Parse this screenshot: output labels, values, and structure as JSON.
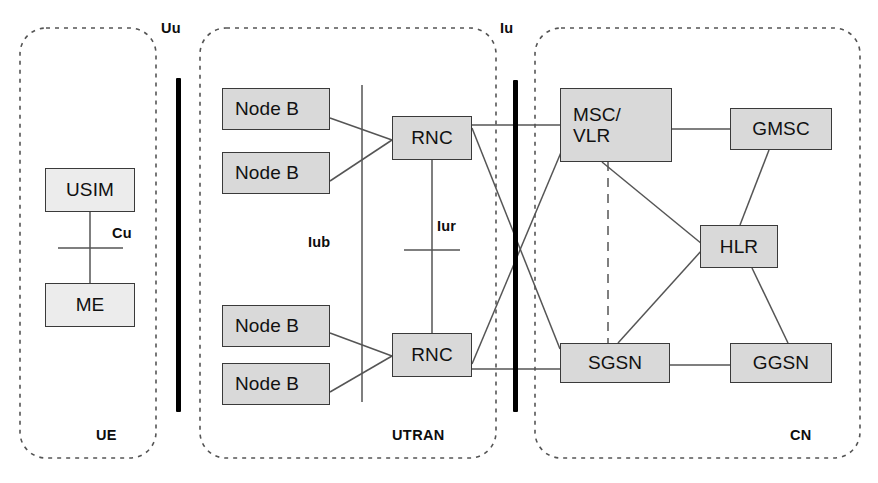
{
  "diagram": {
    "canvas": {
      "width": 878,
      "height": 483
    },
    "background_color": "#ffffff",
    "box_fill_color": "#d9d9d9",
    "box_border_color": "#3a3a3a",
    "line_color": "#555555",
    "domains": [
      {
        "id": "ue",
        "label": "UE",
        "x": 20,
        "y": 28,
        "width": 136,
        "height": 430
      },
      {
        "id": "utran",
        "label": "UTRAN",
        "x": 200,
        "y": 28,
        "width": 296,
        "height": 430
      },
      {
        "id": "cn",
        "label": "CN",
        "x": 535,
        "y": 28,
        "width": 325,
        "height": 430
      }
    ],
    "interfaces": [
      {
        "id": "uu",
        "label": "Uu",
        "style": "thick-bar",
        "x": 178,
        "y_top": 78,
        "y_bottom": 412
      },
      {
        "id": "iu",
        "label": "Iu",
        "style": "thick-bar",
        "x": 515,
        "y_top": 80,
        "y_bottom": 412
      },
      {
        "id": "iub",
        "label": "Iub",
        "style": "thin-line",
        "x": 362,
        "y_top": 85,
        "y_bottom": 402
      },
      {
        "id": "iur",
        "label": "Iur",
        "style": "tick",
        "x": 432,
        "y": 250
      },
      {
        "id": "cu",
        "label": "Cu",
        "style": "tick",
        "x": 85,
        "y": 247
      }
    ],
    "nodes": [
      {
        "id": "usim",
        "label": "USIM",
        "x": 45,
        "y": 168,
        "width": 90,
        "height": 44,
        "fill": "#ececec"
      },
      {
        "id": "me",
        "label": "ME",
        "x": 45,
        "y": 283,
        "width": 90,
        "height": 44,
        "fill": "#ececec"
      },
      {
        "id": "nodeb1",
        "label": "Node B",
        "x": 222,
        "y": 88,
        "width": 108,
        "height": 42,
        "fill": "#d9d9d9"
      },
      {
        "id": "nodeb2",
        "label": "Node B",
        "x": 222,
        "y": 152,
        "width": 108,
        "height": 42,
        "fill": "#d9d9d9"
      },
      {
        "id": "nodeb3",
        "label": "Node B",
        "x": 222,
        "y": 305,
        "width": 108,
        "height": 42,
        "fill": "#d9d9d9"
      },
      {
        "id": "nodeb4",
        "label": "Node B",
        "x": 222,
        "y": 363,
        "width": 108,
        "height": 42,
        "fill": "#d9d9d9"
      },
      {
        "id": "rnc1",
        "label": "RNC",
        "x": 392,
        "y": 116,
        "width": 80,
        "height": 44,
        "fill": "#d9d9d9"
      },
      {
        "id": "rnc2",
        "label": "RNC",
        "x": 392,
        "y": 333,
        "width": 80,
        "height": 44,
        "fill": "#d9d9d9"
      },
      {
        "id": "mscvlr",
        "label": "MSC/\nVLR",
        "x": 560,
        "y": 88,
        "width": 112,
        "height": 74,
        "fill": "#d9d9d9"
      },
      {
        "id": "gmsc",
        "label": "GMSC",
        "x": 730,
        "y": 108,
        "width": 102,
        "height": 42,
        "fill": "#d9d9d9"
      },
      {
        "id": "hlr",
        "label": "HLR",
        "x": 700,
        "y": 225,
        "width": 78,
        "height": 43,
        "fill": "#d9d9d9"
      },
      {
        "id": "sgsn",
        "label": "SGSN",
        "x": 560,
        "y": 343,
        "width": 110,
        "height": 40,
        "fill": "#d9d9d9"
      },
      {
        "id": "ggsn",
        "label": "GGSN",
        "x": 730,
        "y": 343,
        "width": 102,
        "height": 40,
        "fill": "#d9d9d9"
      }
    ],
    "links": [
      {
        "from": "usim",
        "to": "me",
        "style": "solid",
        "interface": "Cu"
      },
      {
        "from": "nodeb1",
        "to": "rnc1",
        "style": "solid",
        "interface": "Iub"
      },
      {
        "from": "nodeb2",
        "to": "rnc1",
        "style": "solid",
        "interface": "Iub"
      },
      {
        "from": "nodeb3",
        "to": "rnc2",
        "style": "solid",
        "interface": "Iub"
      },
      {
        "from": "nodeb4",
        "to": "rnc2",
        "style": "solid",
        "interface": "Iub"
      },
      {
        "from": "rnc1",
        "to": "rnc2",
        "style": "solid",
        "interface": "Iur"
      },
      {
        "from": "rnc1",
        "to": "mscvlr",
        "style": "solid",
        "interface": "Iu-CS"
      },
      {
        "from": "rnc1",
        "to": "sgsn",
        "style": "solid",
        "interface": "Iu-PS"
      },
      {
        "from": "rnc2",
        "to": "sgsn",
        "style": "solid",
        "interface": "Iu-PS"
      },
      {
        "from": "rnc2",
        "to": "mscvlr",
        "style": "solid",
        "interface": "Iu-CS"
      },
      {
        "from": "mscvlr",
        "to": "gmsc",
        "style": "solid",
        "interface": ""
      },
      {
        "from": "mscvlr",
        "to": "hlr",
        "style": "solid",
        "interface": ""
      },
      {
        "from": "mscvlr",
        "to": "sgsn",
        "style": "dashed",
        "interface": "Gs"
      },
      {
        "from": "gmsc",
        "to": "hlr",
        "style": "solid",
        "interface": ""
      },
      {
        "from": "hlr",
        "to": "sgsn",
        "style": "solid",
        "interface": ""
      },
      {
        "from": "hlr",
        "to": "ggsn",
        "style": "solid",
        "interface": ""
      },
      {
        "from": "sgsn",
        "to": "ggsn",
        "style": "solid",
        "interface": "Gn"
      }
    ]
  }
}
